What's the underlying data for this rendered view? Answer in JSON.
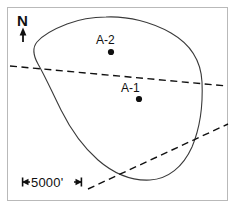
{
  "figure": {
    "kind": "map-diagram",
    "width": 237,
    "height": 209,
    "background_color": "#ffffff",
    "frame_color": "#b9b9b9",
    "ink_color": "#101010",
    "outline_color": "#3a3a3a"
  },
  "north_arrow": {
    "label": "N",
    "icon": "north-arrow-icon",
    "shaft_x": 23,
    "shaft_top_y": 42,
    "shaft_bottom_y": 30
  },
  "wells": [
    {
      "id": "A-2",
      "label": "A-2",
      "marker": "well-dot",
      "label_x": 96,
      "label_y": 34,
      "dot_x": 111,
      "dot_y": 52,
      "dot_radius": 3.1
    },
    {
      "id": "A-1",
      "label": "A-1",
      "marker": "well-dot",
      "label_x": 121,
      "label_y": 82,
      "dot_x": 139,
      "dot_y": 99,
      "dot_radius": 3.1
    }
  ],
  "scale_bar": {
    "label": "5000'",
    "units": "feet",
    "value": 5000,
    "left_tick_x": 22,
    "right_tick_x": 82,
    "y": 182,
    "left_arrow": "left-arrow-cap",
    "right_arrow": "right-arrow-cap"
  },
  "outline": {
    "name": "closed-boundary-curve",
    "style": "solid",
    "stroke_width": 1.1,
    "path": "M 106,17 C 128,16 152,22 171,33 C 190,44 201,60 202,82 C 203,104 200,128 192,147 C 183,167 168,179 150,180 C 131,181 113,173 98,160 C 82,146 70,128 61,110 C 52,92 45,76 38,64 C 33,55 32,48 37,42 C 43,35 54,29 67,24 C 80,19 93,17 106,17 Z"
  },
  "faults": [
    {
      "name": "fault-trace-upper",
      "style": "dashed",
      "dash_pattern": "7 4.5",
      "stroke_width": 1.4,
      "x1": 10,
      "y1": 66,
      "x2": 227,
      "y2": 86
    },
    {
      "name": "fault-trace-lower",
      "style": "dashed",
      "dash_pattern": "7 4.5",
      "stroke_width": 1.4,
      "x1": 88,
      "y1": 189,
      "x2": 228,
      "y2": 124
    }
  ]
}
